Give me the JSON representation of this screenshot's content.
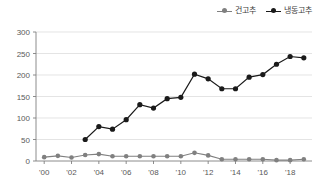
{
  "chart_data": {
    "type": "line",
    "title": "",
    "xlabel": "",
    "ylabel": "",
    "x": [
      2000,
      2001,
      2002,
      2003,
      2004,
      2005,
      2006,
      2007,
      2008,
      2009,
      2010,
      2011,
      2012,
      2013,
      2014,
      2015,
      2016,
      2017,
      2018,
      2019
    ],
    "xtick_labels": [
      "'00",
      "'02",
      "'04",
      "'06",
      "'08",
      "'10",
      "'12",
      "'14",
      "'16",
      "'18"
    ],
    "xtick_values": [
      2000,
      2002,
      2004,
      2006,
      2008,
      2010,
      2012,
      2014,
      2016,
      2018
    ],
    "ytick_labels": [
      "0",
      "50",
      "100",
      "150",
      "200",
      "250",
      "300"
    ],
    "ytick_values": [
      0,
      50,
      100,
      150,
      200,
      250,
      300
    ],
    "ylim": [
      0,
      300
    ],
    "xlim": [
      1999.4,
      2019.6
    ],
    "grid": "horizontal",
    "legend_position": "top-right",
    "series": [
      {
        "name": "건고추",
        "color": "#808080",
        "marker": "circle",
        "values": [
          9,
          12,
          8,
          14,
          16,
          11,
          11,
          11,
          11,
          11,
          11,
          19,
          13,
          4,
          4,
          4,
          4,
          2,
          2,
          4
        ]
      },
      {
        "name": "냉동고추",
        "color": "#1a1a1a",
        "marker": "circle",
        "values": [
          null,
          null,
          null,
          50,
          80,
          74,
          96,
          131,
          123,
          145,
          148,
          202,
          191,
          168,
          168,
          195,
          201,
          225,
          243,
          240
        ]
      }
    ]
  },
  "legend": {
    "items": [
      {
        "label": "건고추",
        "color": "#808080",
        "icon": "line-marker-icon"
      },
      {
        "label": "냉동고추",
        "color": "#1a1a1a",
        "icon": "line-marker-icon"
      }
    ]
  },
  "colors": {
    "dried_pepper": "#808080",
    "frozen_pepper": "#1a1a1a",
    "gridline": "#d9d9d9",
    "axis": "#808080",
    "tick_text": "#595959",
    "background": "#ffffff"
  }
}
